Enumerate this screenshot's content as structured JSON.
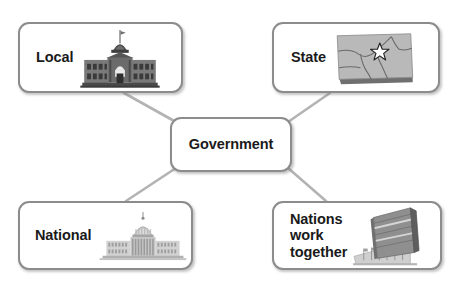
{
  "diagram": {
    "type": "concept-map",
    "center": {
      "id": "government",
      "label": "Government"
    },
    "nodes": [
      {
        "id": "local",
        "label": "Local",
        "icon": "city-hall-building-icon",
        "position": "top-left"
      },
      {
        "id": "state",
        "label": "State",
        "icon": "state-map-with-star-icon",
        "position": "top-right"
      },
      {
        "id": "national",
        "label": "National",
        "icon": "us-capitol-building-icon",
        "position": "bottom-left"
      },
      {
        "id": "nations",
        "label": "Nations\nwork\ntogether",
        "icon": "un-headquarters-tower-icon",
        "position": "bottom-right"
      }
    ],
    "connectors": [
      {
        "from": "local",
        "to": "government"
      },
      {
        "from": "state",
        "to": "government"
      },
      {
        "from": "national",
        "to": "government"
      },
      {
        "from": "nations",
        "to": "government"
      }
    ]
  },
  "colors": {
    "box_border": "#8c8c8c",
    "box_fill": "#ffffff",
    "text": "#1a1a1a",
    "connector": "#b3b3b3",
    "icon_dark": "#4d4d4d",
    "icon_mid": "#8a8a8a",
    "icon_light": "#c9c9c9",
    "page_background": "#ffffff"
  }
}
